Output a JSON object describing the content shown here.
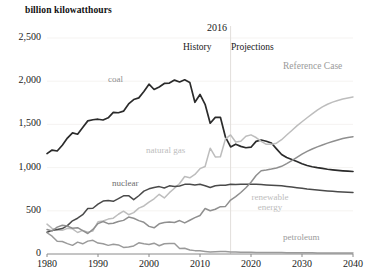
{
  "chart_data": {
    "type": "line",
    "title": "",
    "ylabel": "billion kilowatthours",
    "xlabel": "",
    "xlim": [
      1980,
      2040
    ],
    "ylim": [
      0,
      2500
    ],
    "grid": false,
    "legend_position": "inline-labels",
    "x_ticks": [
      "1980",
      "1990",
      "2000",
      "2010",
      "2020",
      "2030",
      "2040"
    ],
    "x_tick_values": [
      1980,
      1990,
      2000,
      2010,
      2020,
      2030,
      2040
    ],
    "y_ticks": [
      "0",
      "500",
      "1,000",
      "1,500",
      "2,000",
      "2,500"
    ],
    "y_tick_values": [
      0,
      500,
      1000,
      1500,
      2000,
      2500
    ],
    "divider_year": 2016,
    "divider_label": "2016",
    "region_left_label": "History",
    "region_right_label": "Projections",
    "scenario_label": "Reference Case",
    "x": [
      1980,
      1981,
      1982,
      1983,
      1984,
      1985,
      1986,
      1987,
      1988,
      1989,
      1990,
      1991,
      1992,
      1993,
      1994,
      1995,
      1996,
      1997,
      1998,
      1999,
      2000,
      2001,
      2002,
      2003,
      2004,
      2005,
      2006,
      2007,
      2008,
      2009,
      2010,
      2011,
      2012,
      2013,
      2014,
      2015,
      2016,
      2017,
      2018,
      2019,
      2020,
      2021,
      2022,
      2023,
      2024,
      2025,
      2026,
      2027,
      2028,
      2029,
      2030,
      2031,
      2032,
      2033,
      2034,
      2035,
      2036,
      2037,
      2038,
      2039,
      2040
    ],
    "series": [
      {
        "name": "coal",
        "color": "#2b2b2b",
        "label": "coal",
        "values": [
          1162,
          1203,
          1192,
          1259,
          1342,
          1402,
          1386,
          1464,
          1541,
          1554,
          1560,
          1551,
          1576,
          1639,
          1635,
          1653,
          1737,
          1788,
          1807,
          1881,
          1966,
          1904,
          1933,
          1974,
          1978,
          2013,
          1991,
          2016,
          1986,
          1756,
          1847,
          1733,
          1514,
          1581,
          1582,
          1352,
          1239,
          1271,
          1246,
          1230,
          1236,
          1304,
          1319,
          1305,
          1284,
          1217,
          1152,
          1116,
          1093,
          1070,
          1045,
          1024,
          1010,
          999,
          990,
          981,
          974,
          968,
          963,
          959,
          955
        ]
      },
      {
        "name": "natural gas",
        "color": "#bdbdbd",
        "label": "natural gas",
        "values": [
          346,
          297,
          277,
          274,
          297,
          292,
          249,
          273,
          253,
          267,
          373,
          382,
          404,
          415,
          460,
          496,
          455,
          479,
          531,
          556,
          601,
          639,
          691,
          649,
          710,
          761,
          816,
          897,
          882,
          921,
          988,
          1013,
          1225,
          1124,
          1126,
          1333,
          1378,
          1296,
          1304,
          1362,
          1379,
          1348,
          1303,
          1269,
          1270,
          1282,
          1323,
          1378,
          1430,
          1483,
          1531,
          1577,
          1622,
          1665,
          1702,
          1733,
          1758,
          1777,
          1793,
          1806,
          1817
        ]
      },
      {
        "name": "nuclear",
        "color": "#4a4a4a",
        "label": "nuclear",
        "values": [
          251,
          273,
          283,
          294,
          328,
          384,
          414,
          455,
          527,
          529,
          577,
          613,
          619,
          610,
          640,
          673,
          675,
          629,
          674,
          728,
          754,
          769,
          780,
          764,
          789,
          782,
          787,
          806,
          806,
          799,
          807,
          790,
          769,
          789,
          797,
          797,
          806,
          805,
          807,
          808,
          807,
          806,
          803,
          800,
          797,
          793,
          789,
          782,
          775,
          768,
          760,
          752,
          746,
          740,
          734,
          729,
          725,
          721,
          717,
          714,
          711
        ]
      },
      {
        "name": "renewable energy",
        "color": "#8f8f8f",
        "label": "renewable energy",
        "label_lines": [
          "renewable",
          "energy"
        ],
        "values": [
          284,
          266,
          311,
          332,
          323,
          298,
          305,
          270,
          237,
          285,
          352,
          376,
          351,
          356,
          377,
          389,
          428,
          414,
          386,
          367,
          320,
          303,
          349,
          364,
          369,
          365,
          387,
          360,
          391,
          421,
          445,
          526,
          500,
          518,
          548,
          551,
          624,
          664,
          712,
          767,
          831,
          908,
          963,
          972,
          983,
          996,
          1015,
          1046,
          1080,
          1118,
          1156,
          1188,
          1215,
          1240,
          1262,
          1283,
          1303,
          1320,
          1336,
          1348,
          1358
        ]
      },
      {
        "name": "petroleum",
        "color": "#9a9a9a",
        "label": "petroleum",
        "values": [
          246,
          206,
          147,
          144,
          120,
          100,
          137,
          118,
          149,
          158,
          126,
          119,
          100,
          112,
          105,
          76,
          81,
          93,
          129,
          118,
          111,
          125,
          95,
          119,
          121,
          122,
          64,
          66,
          46,
          39,
          37,
          30,
          23,
          27,
          30,
          28,
          24,
          22,
          21,
          20,
          19,
          18,
          18,
          17,
          17,
          16,
          16,
          15,
          15,
          15,
          14,
          14,
          14,
          13,
          13,
          13,
          12,
          12,
          12,
          12,
          12
        ]
      }
    ]
  }
}
